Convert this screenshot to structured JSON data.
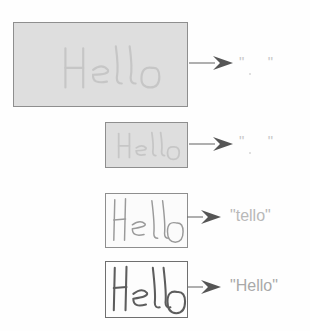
{
  "figure": {
    "background_color": "#fefefe",
    "ink_color": "#8e8e8e",
    "arrow_color": "#6e6e6e",
    "output_text_color": "#b5b5b5",
    "handwritten_word": "Hello"
  },
  "rows": [
    {
      "id": "row-1",
      "sample": {
        "name": "lowest-resolution-sample",
        "word": "Hello",
        "noise_level": "heavy",
        "legibility": "illegible",
        "box": {
          "x": 13,
          "y": 22,
          "width": 175,
          "height": 85
        },
        "fill_color": "#dedede",
        "border_color": "#8e8e8e"
      },
      "arrow": {
        "name": "arrow-row-1",
        "x": 191,
        "y": 62,
        "length": 42
      },
      "output": {
        "name": "output-row-1",
        "text": "\"  \"",
        "style": "empty",
        "color": "#c9c9c9",
        "x": 240,
        "y": 56
      }
    },
    {
      "id": "row-2",
      "sample": {
        "name": "low-resolution-sample",
        "word": "Hello",
        "noise_level": "heavy",
        "legibility": "illegible",
        "box": {
          "x": 105,
          "y": 122,
          "width": 83,
          "height": 46
        },
        "fill_color": "#dedede",
        "border_color": "#8e8e8e"
      },
      "arrow": {
        "name": "arrow-row-2",
        "x": 191,
        "y": 143,
        "length": 42
      },
      "output": {
        "name": "output-row-2",
        "text": "\"  \"",
        "style": "empty",
        "color": "#c9c9c9",
        "x": 240,
        "y": 135
      }
    },
    {
      "id": "row-3",
      "sample": {
        "name": "medium-resolution-sample",
        "word": "Hello",
        "noise_level": "light",
        "legibility": "faint",
        "box": {
          "x": 105,
          "y": 193,
          "width": 83,
          "height": 55
        },
        "fill_color": "#fbfbfb",
        "border_color": "#8e8e8e"
      },
      "arrow": {
        "name": "arrow-row-3",
        "x": 188,
        "y": 216,
        "length": 32
      },
      "output": {
        "name": "output-row-3",
        "text": "\"tello\"",
        "style": "faint",
        "color": "#b9b9b9",
        "x": 231,
        "y": 209
      }
    },
    {
      "id": "row-4",
      "sample": {
        "name": "high-resolution-sample",
        "word": "Hello",
        "noise_level": "minimal",
        "legibility": "clear",
        "box": {
          "x": 105,
          "y": 261,
          "width": 83,
          "height": 57
        },
        "fill_color": "#fdfdfd",
        "border_color": "#6f6f6f"
      },
      "arrow": {
        "name": "arrow-row-4",
        "x": 188,
        "y": 286,
        "length": 32
      },
      "output": {
        "name": "output-row-4",
        "text": "\"Hello\"",
        "style": "strong",
        "color": "#a9a9a9",
        "x": 231,
        "y": 279
      }
    }
  ]
}
